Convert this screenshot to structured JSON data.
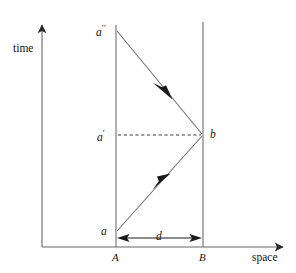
{
  "figure": {
    "type": "minkowski-spacetime-diagram",
    "axes": {
      "time_label": "time",
      "space_label": "space",
      "origin": [
        42,
        247
      ],
      "time_axis_top": 18,
      "space_axis_right": 290
    },
    "worldlines": [
      {
        "name": "A",
        "label": "A",
        "x": 116,
        "y_bottom": 247,
        "y_top": 25
      },
      {
        "name": "B",
        "label": "B",
        "x": 203,
        "y_bottom": 247,
        "y_top": 22
      }
    ],
    "events": [
      {
        "id": "a",
        "label": "a",
        "prime": "",
        "x": 116,
        "y": 232
      },
      {
        "id": "a1",
        "label": "a",
        "prime": "′",
        "x": 116,
        "y": 135
      },
      {
        "id": "a2",
        "label": "a",
        "prime": "′′",
        "x": 116,
        "y": 30
      },
      {
        "id": "b",
        "label": "b",
        "prime": "",
        "x": 203,
        "y": 135
      }
    ],
    "signals": [
      {
        "id": "outgoing",
        "from": "a",
        "to": "b",
        "arrow_direction": "up-right",
        "arrow_at": [
          162,
          182
        ]
      },
      {
        "id": "returning",
        "from": "b",
        "to": "a2",
        "arrow_direction": "up-left",
        "arrow_at": [
          163,
          93
        ]
      }
    ],
    "simultaneity_line": {
      "style": "dashed",
      "from": "a1",
      "to": "b",
      "y": 135
    },
    "distance": {
      "label": "d",
      "from_x": 116,
      "to_x": 203,
      "y": 238,
      "double_headed": true
    },
    "colors": {
      "stroke": "#5a5a5a",
      "axis": "#4a4a4a",
      "text": "#141414",
      "background": "#ffffff"
    }
  }
}
